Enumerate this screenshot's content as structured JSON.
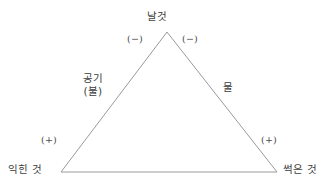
{
  "diagram": {
    "background_color": "#ffffff",
    "stroke_color": "#9a9a9a",
    "text_color": "#3c3c3c",
    "vertices": {
      "apex": "날것",
      "bottom_left": "익힌 것",
      "bottom_right": "썩은 것"
    },
    "edges": {
      "left_primary": "공기",
      "left_secondary": "(불)",
      "right_primary": "물"
    },
    "signs": {
      "apex_left": "(−)",
      "apex_right": "(−)",
      "base_left": "(+)",
      "base_right": "(+)"
    }
  }
}
